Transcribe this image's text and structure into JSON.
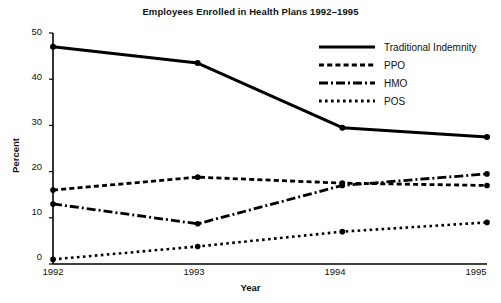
{
  "chart_data": {
    "type": "line",
    "title": "Employees Enrolled in Health Plans 1992–1995",
    "xlabel": "Year",
    "ylabel": "Percent",
    "categories": [
      "1992",
      "1993",
      "1994",
      "1995"
    ],
    "x": [
      1992,
      1993,
      1994,
      1995
    ],
    "xlim": [
      1992,
      1995
    ],
    "ylim": [
      0,
      50
    ],
    "yticks": [
      0,
      10,
      20,
      30,
      40,
      50
    ],
    "xticks": [
      "1992",
      "1993",
      "1994",
      "1995"
    ],
    "grid": false,
    "legend_position": "upper right",
    "series": [
      {
        "name": "Traditional Indemnity",
        "style": "solid",
        "color": "#000000",
        "values": [
          47,
          43.5,
          29.5,
          27.5
        ]
      },
      {
        "name": "PPO",
        "style": "dashed",
        "color": "#000000",
        "values": [
          16,
          18.8,
          17.5,
          17
        ]
      },
      {
        "name": "HMO",
        "style": "dash-dot",
        "color": "#000000",
        "values": [
          13,
          8.7,
          17,
          19.5
        ]
      },
      {
        "name": "POS",
        "style": "dotted",
        "color": "#000000",
        "values": [
          1,
          3.8,
          7,
          9
        ]
      }
    ]
  },
  "legend": {
    "items": [
      {
        "label": "Traditional Indemnity",
        "style": "solid"
      },
      {
        "label": "PPO",
        "style": "dashed"
      },
      {
        "label": "HMO",
        "style": "dash-dot"
      },
      {
        "label": "POS",
        "style": "dotted"
      }
    ]
  },
  "axes": {
    "y_tick_labels": [
      "50",
      "40",
      "30",
      "20",
      "10",
      "0"
    ],
    "x_tick_labels": [
      "1992",
      "1993",
      "1994",
      "1995"
    ]
  },
  "colors": {
    "ink": "#000000",
    "background": "#ffffff"
  }
}
